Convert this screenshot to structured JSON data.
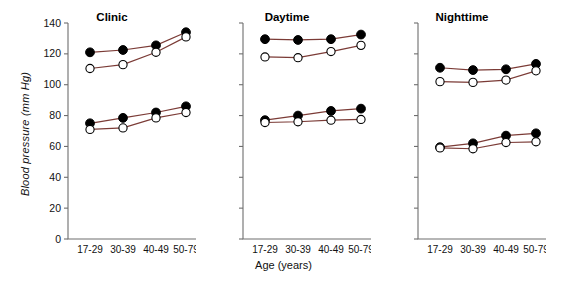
{
  "chart_data": {
    "type": "line",
    "title": "",
    "xlabel": "Age (years)",
    "ylabel": "Blood pressure (mm Hg)",
    "categories": [
      "17-29",
      "30-39",
      "40-49",
      "50-79"
    ],
    "ylim": [
      0,
      140
    ],
    "yticks": [
      0,
      20,
      40,
      60,
      80,
      100,
      120,
      140
    ],
    "grid": false,
    "legend": "none",
    "line_color": "#7B3B36",
    "marker_filled_color": "#000000",
    "marker_open_color": "#FFFFFF",
    "panels": [
      {
        "title": "Clinic",
        "series": [
          {
            "name": "Systolic - men (filled)",
            "marker": "filled",
            "values": [
              121,
              122.5,
              125.5,
              134
            ]
          },
          {
            "name": "Systolic - women (open)",
            "marker": "open",
            "values": [
              110.5,
              113,
              121,
              131
            ]
          },
          {
            "name": "Diastolic - men (filled)",
            "marker": "filled",
            "values": [
              75,
              78.5,
              82,
              86
            ]
          },
          {
            "name": "Diastolic - women (open)",
            "marker": "open",
            "values": [
              71,
              72,
              78.5,
              82
            ]
          }
        ]
      },
      {
        "title": "Daytime",
        "series": [
          {
            "name": "Systolic - men (filled)",
            "marker": "filled",
            "values": [
              129.5,
              129,
              129.5,
              132.5
            ]
          },
          {
            "name": "Systolic - women (open)",
            "marker": "open",
            "values": [
              118,
              117.5,
              121.5,
              125.5
            ]
          },
          {
            "name": "Diastolic - men (filled)",
            "marker": "filled",
            "values": [
              77,
              80,
              83,
              84.5
            ]
          },
          {
            "name": "Diastolic - women (open)",
            "marker": "open",
            "values": [
              75.5,
              76,
              77,
              77.5
            ]
          }
        ]
      },
      {
        "title": "Nighttime",
        "series": [
          {
            "name": "Systolic - men (filled)",
            "marker": "filled",
            "values": [
              111,
              109.5,
              110,
              113.5
            ]
          },
          {
            "name": "Systolic - women (open)",
            "marker": "open",
            "values": [
              102,
              101.5,
              103,
              109
            ]
          },
          {
            "name": "Diastolic - men (filled)",
            "marker": "filled",
            "values": [
              59.5,
              62,
              67,
              68.5
            ]
          },
          {
            "name": "Diastolic - women (open)",
            "marker": "open",
            "values": [
              59,
              58.5,
              62.5,
              63
            ]
          }
        ]
      }
    ]
  }
}
